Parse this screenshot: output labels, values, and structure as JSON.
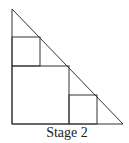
{
  "caption": "Stage 2",
  "colors": {
    "stroke": "#333333",
    "background": "#ffffff"
  },
  "diagram": {
    "triangle": {
      "points": [
        [
          12,
          9
        ],
        [
          12,
          124
        ],
        [
          123,
          124
        ]
      ]
    },
    "squares": [
      {
        "name": "large-square",
        "x": 12,
        "y": 66,
        "size": 57
      },
      {
        "name": "upper-small-square",
        "x": 12,
        "y": 37,
        "size": 28
      },
      {
        "name": "lower-small-square",
        "x": 69,
        "y": 95,
        "size": 28
      }
    ]
  }
}
